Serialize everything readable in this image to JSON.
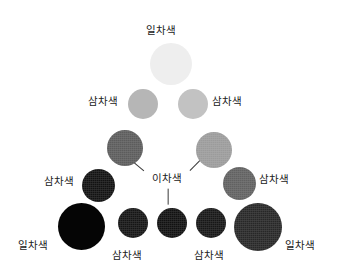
{
  "diagram": {
    "background": "#ffffff",
    "width": 337,
    "height": 278,
    "terms": {
      "primary": "일차색",
      "secondary": "이차색",
      "tertiary": "삼차색"
    },
    "swatches": [
      {
        "id": "apex",
        "tier": "primary",
        "label": "일차색",
        "color": "#eeeeee",
        "x": 150,
        "y": 43,
        "size": 42,
        "textured": false
      },
      {
        "id": "upper-left",
        "tier": "tertiary",
        "label": "삼차색",
        "color": "#b6b6b6",
        "x": 128,
        "y": 89,
        "size": 30,
        "textured": false
      },
      {
        "id": "upper-right",
        "tier": "tertiary",
        "label": "삼차색",
        "color": "#c2c2c2",
        "x": 178,
        "y": 89,
        "size": 30,
        "textured": false
      },
      {
        "id": "mid-left",
        "tier": "secondary",
        "label": "이차색",
        "color": "#5c5c5c",
        "x": 107,
        "y": 130,
        "size": 36,
        "textured": true
      },
      {
        "id": "mid-right",
        "tier": "secondary",
        "label": "이차색",
        "color": "#9b9b9b",
        "x": 196,
        "y": 132,
        "size": 36,
        "textured": true
      },
      {
        "id": "low-left",
        "tier": "tertiary",
        "label": "삼차색",
        "color": "#121212",
        "x": 82,
        "y": 169,
        "size": 33,
        "textured": true
      },
      {
        "id": "low-right",
        "tier": "tertiary",
        "label": "삼차색",
        "color": "#616161",
        "x": 223,
        "y": 167,
        "size": 33,
        "textured": true
      },
      {
        "id": "base-left",
        "tier": "primary",
        "label": "일차색",
        "color": "#050505",
        "x": 58,
        "y": 203,
        "size": 47,
        "textured": false
      },
      {
        "id": "base-m1",
        "tier": "tertiary",
        "label": "삼차색",
        "color": "#151515",
        "x": 118,
        "y": 208,
        "size": 30,
        "textured": true
      },
      {
        "id": "base-m2",
        "tier": "secondary",
        "label": "이차색",
        "color": "#111111",
        "x": 157,
        "y": 208,
        "size": 30,
        "textured": true
      },
      {
        "id": "base-m3",
        "tier": "tertiary",
        "label": "삼차색",
        "color": "#171717",
        "x": 196,
        "y": 208,
        "size": 30,
        "textured": true
      },
      {
        "id": "base-right",
        "tier": "primary",
        "label": "일차색",
        "color": "#272727",
        "x": 234,
        "y": 203,
        "size": 48,
        "textured": true
      }
    ],
    "labels": [
      {
        "id": "label-apex",
        "text": "일차색",
        "x": 146,
        "y": 24,
        "align": "left"
      },
      {
        "id": "label-upper-left",
        "text": "삼차색",
        "x": 88,
        "y": 95,
        "align": "left"
      },
      {
        "id": "label-upper-right",
        "text": "삼차색",
        "x": 212,
        "y": 95,
        "align": "left"
      },
      {
        "id": "label-secondary",
        "text": "이차색",
        "x": 152,
        "y": 172,
        "align": "left"
      },
      {
        "id": "label-low-left",
        "text": "삼차색",
        "x": 44,
        "y": 175,
        "align": "left"
      },
      {
        "id": "label-low-right",
        "text": "삼차색",
        "x": 259,
        "y": 173,
        "align": "left"
      },
      {
        "id": "label-base-left",
        "text": "일차색",
        "x": 18,
        "y": 239,
        "align": "left"
      },
      {
        "id": "label-base-m1",
        "text": "삼차색",
        "x": 112,
        "y": 249,
        "align": "left"
      },
      {
        "id": "label-base-m3",
        "text": "삼차색",
        "x": 194,
        "y": 249,
        "align": "left"
      },
      {
        "id": "label-base-right",
        "text": "일차색",
        "x": 285,
        "y": 239,
        "align": "left"
      }
    ],
    "connectors": [
      {
        "id": "connector-to-mid-left",
        "x1": 144,
        "y1": 170,
        "x2": 126,
        "y2": 155
      },
      {
        "id": "connector-to-mid-right",
        "x1": 190,
        "y1": 170,
        "x2": 205,
        "y2": 155
      },
      {
        "id": "connector-to-base-m2",
        "x1": 168,
        "y1": 188,
        "x2": 168,
        "y2": 204
      }
    ]
  }
}
